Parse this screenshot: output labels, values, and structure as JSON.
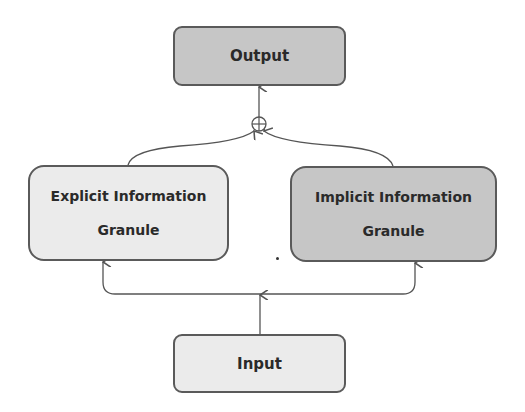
{
  "diagram": {
    "nodes": {
      "output": {
        "label": "Output",
        "fill": "#c6c6c6"
      },
      "explicit": {
        "label_line1": "Explicit Information",
        "label_line2": "Granule",
        "fill": "#ebebeb"
      },
      "implicit": {
        "label_line1": "Implicit Information",
        "label_line2": "Granule",
        "fill": "#c6c6c6"
      },
      "input": {
        "label": "Input",
        "fill": "#ebebeb"
      }
    },
    "combine_operator": {
      "symbol": "⊕",
      "meaning": "element-wise sum"
    },
    "edges": [
      {
        "from": "input",
        "to": "explicit"
      },
      {
        "from": "input",
        "to": "implicit"
      },
      {
        "from": "explicit",
        "to": "combine_operator"
      },
      {
        "from": "implicit",
        "to": "combine_operator"
      },
      {
        "from": "combine_operator",
        "to": "output"
      }
    ],
    "colors": {
      "border": "#5a5a5a",
      "line": "#555555",
      "text": "#2a2a2a"
    }
  }
}
